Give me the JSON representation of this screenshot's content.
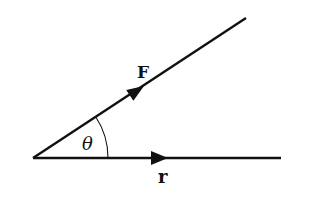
{
  "diagram": {
    "type": "vector-angle",
    "background": "#ffffff",
    "stroke_color": "#111111",
    "origin": [
      33,
      158
    ],
    "vectors": [
      {
        "name": "F",
        "label": "F",
        "end": [
          246,
          18
        ],
        "arrow_at": [
          140,
          88
        ],
        "label_pos": [
          137,
          64
        ],
        "bold": true
      },
      {
        "name": "r",
        "label": "r",
        "end": [
          281,
          158
        ],
        "arrow_at": [
          163,
          158
        ],
        "label_pos": [
          158,
          170
        ],
        "bold": true
      }
    ],
    "angle": {
      "label": "θ",
      "radius": 75,
      "label_pos": [
        82,
        135
      ]
    }
  }
}
